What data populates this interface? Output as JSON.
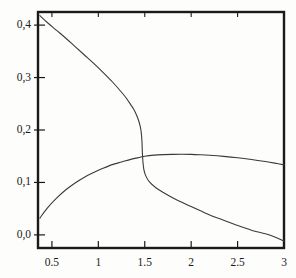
{
  "chart_data": {
    "type": "line",
    "title": "",
    "subtitle": "",
    "xlabel": "",
    "ylabel": "",
    "xlim": [
      0.35,
      3.0
    ],
    "ylim": [
      -0.025,
      0.425
    ],
    "grid": false,
    "legend": null,
    "x_tick_labels": [
      "0.5",
      "1",
      "1.5",
      "2",
      "2.5",
      "3"
    ],
    "x_tick_values": [
      0.5,
      1,
      1.5,
      2,
      2.5,
      3
    ],
    "y_tick_labels": [
      "0,0",
      "0,1",
      "0,2",
      "0,3",
      "0,4"
    ],
    "y_tick_values": [
      0.0,
      0.1,
      0.2,
      0.3,
      0.4
    ],
    "decimal_separator_y": ",",
    "decimal_separator_x": ".",
    "line_color": "#3a3a3a",
    "axis_color": "#1a1a1a",
    "background_color": "#fdfdfb",
    "series": [
      {
        "name": "descending-branch",
        "color": "#3a3a3a",
        "x": [
          0.37,
          0.45,
          0.55,
          0.65,
          0.75,
          0.85,
          0.95,
          1.05,
          1.15,
          1.25,
          1.3,
          1.35,
          1.38,
          1.41,
          1.43,
          1.45,
          1.46,
          1.465,
          1.47,
          1.472,
          1.475,
          1.48,
          1.49,
          1.51,
          1.55,
          1.62,
          1.7,
          1.8,
          1.9,
          2.0,
          2.1,
          2.2,
          2.35,
          2.5,
          2.65,
          2.8,
          2.9,
          3.0
        ],
        "y": [
          0.418,
          0.405,
          0.39,
          0.375,
          0.359,
          0.343,
          0.327,
          0.31,
          0.292,
          0.272,
          0.261,
          0.248,
          0.24,
          0.229,
          0.22,
          0.208,
          0.198,
          0.19,
          0.178,
          0.168,
          0.155,
          0.14,
          0.125,
          0.113,
          0.101,
          0.09,
          0.081,
          0.071,
          0.062,
          0.054,
          0.046,
          0.038,
          0.028,
          0.018,
          0.009,
          0.002,
          -0.004,
          -0.012
        ]
      },
      {
        "name": "rising-branch",
        "color": "#3a3a3a",
        "x": [
          0.37,
          0.45,
          0.55,
          0.65,
          0.75,
          0.85,
          0.95,
          1.05,
          1.15,
          1.25,
          1.35,
          1.45,
          1.5,
          1.6,
          1.7,
          1.8,
          1.9,
          2.0,
          2.1,
          2.2,
          2.35,
          2.5,
          2.65,
          2.8,
          2.9,
          3.0
        ],
        "y": [
          0.032,
          0.051,
          0.07,
          0.086,
          0.099,
          0.11,
          0.119,
          0.127,
          0.134,
          0.139,
          0.144,
          0.148,
          0.15,
          0.152,
          0.153,
          0.1535,
          0.1537,
          0.1535,
          0.1528,
          0.1518,
          0.1498,
          0.1472,
          0.1438,
          0.1398,
          0.1368,
          0.1335
        ]
      }
    ]
  },
  "figure": {
    "frame": {
      "left_px": 38,
      "right_px": 284,
      "top_px": 12,
      "bottom_px": 248
    }
  }
}
